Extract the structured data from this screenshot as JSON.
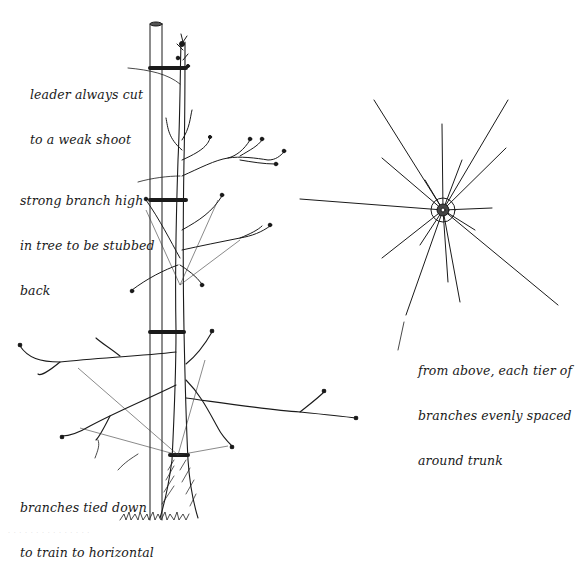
{
  "figure": {
    "background": "#ffffff",
    "ink_color": "#1a1a1a"
  },
  "labels": {
    "leader": {
      "line1": "leader always cut",
      "line2": "to a weak shoot"
    },
    "strong_branch": {
      "line1": "strong branch high",
      "line2": "in tree to be stubbed",
      "line3": "back"
    },
    "tied_down": {
      "line1": "branches tied down",
      "line2": "to train to horizontal"
    },
    "from_above": {
      "line1": "from above, each tier of",
      "line2": "branches evenly spaced",
      "line3": "around trunk"
    }
  },
  "side_view": {
    "stake": {
      "x_left": 150,
      "x_right": 162,
      "top": 22,
      "bottom": 520
    },
    "trunk": {
      "x": 178,
      "top": 40,
      "base_y": 518,
      "base_width": 30
    },
    "ties_y": [
      68,
      200,
      332,
      455
    ],
    "tiers": [
      {
        "name": "top",
        "y": 70
      },
      {
        "name": "upper",
        "y": 180
      },
      {
        "name": "middle",
        "y": 250
      },
      {
        "name": "lower",
        "y": 380
      }
    ]
  },
  "top_view": {
    "center": {
      "x": 443,
      "y": 210
    },
    "branch_count": 16,
    "branch_tips": [
      [
        374,
        100
      ],
      [
        442,
        124
      ],
      [
        462,
        160
      ],
      [
        508,
        100
      ],
      [
        506,
        148
      ],
      [
        492,
        208
      ],
      [
        558,
        305
      ],
      [
        460,
        302
      ],
      [
        448,
        282
      ],
      [
        406,
        315
      ],
      [
        382,
        258
      ],
      [
        300,
        199
      ],
      [
        382,
        158
      ],
      [
        425,
        180
      ],
      [
        475,
        230
      ],
      [
        420,
        245
      ]
    ]
  },
  "footer": {
    "watermark": "· · · · · · · · · · · · · · ·"
  }
}
